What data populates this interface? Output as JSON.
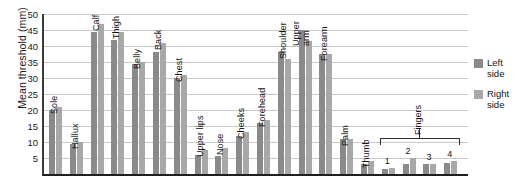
{
  "chart_data": {
    "type": "bar",
    "title": "",
    "xlabel": "",
    "ylabel": "Mean threshold (mm)",
    "ylim": [
      0,
      50
    ],
    "ytick_step": 5,
    "yticks": [
      "5",
      "10",
      "15",
      "20",
      "25",
      "30",
      "35",
      "40",
      "45",
      "50"
    ],
    "grid": true,
    "legend_position": "right",
    "categories": [
      "Sole",
      "Hallux",
      "Calf",
      "Thigh",
      "Belly",
      "Back",
      "Chest",
      "Upper lips",
      "Nose",
      "Cheeks",
      "Forehead",
      "Shoulder",
      "Upper arm",
      "Forearm",
      "Palm",
      "Thumb",
      "1",
      "2",
      "3",
      "4"
    ],
    "series": [
      {
        "name": "Left side",
        "color": "#8a8a8a",
        "values": [
          20,
          9.5,
          44.5,
          42,
          34.5,
          38,
          30,
          6,
          5.5,
          12,
          16,
          38,
          45,
          37.5,
          11,
          3,
          1.5,
          3,
          3,
          3.5
        ]
      },
      {
        "name": "Right side",
        "color": "#a8a8a8",
        "values": [
          21,
          10,
          47,
          44.5,
          35,
          41,
          31,
          7.5,
          8,
          13,
          17,
          36,
          41.5,
          37.5,
          11,
          4,
          2,
          5,
          3,
          4
        ]
      }
    ],
    "annotations": [
      {
        "name": "fingers-bracket",
        "label": "Fingers",
        "spans": [
          "1",
          "2",
          "3",
          "4"
        ]
      }
    ]
  },
  "axis": {
    "y_title": "Mean threshold (mm)"
  },
  "legend": {
    "items": [
      {
        "label_line1": "Left",
        "label_line2": "side",
        "color": "#8a8a8a"
      },
      {
        "label_line1": "Right",
        "label_line2": "side",
        "color": "#a8a8a8"
      }
    ]
  },
  "fingers": {
    "label": "Fingers"
  }
}
